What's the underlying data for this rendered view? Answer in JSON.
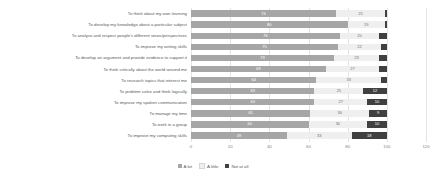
{
  "chart_data": {
    "type": "bar",
    "orientation": "horizontal",
    "stacked": true,
    "title": "",
    "subtitle": "",
    "xlabel": "",
    "ylabel": "",
    "xlim": [
      0,
      120
    ],
    "xticks": [
      "0",
      "20",
      "40",
      "60",
      "80",
      "100",
      "120"
    ],
    "grid": true,
    "legend_position": "bottom",
    "categories": [
      "To think about my own learning",
      "To develop my knowledge about a particular subject",
      "To analyse and respect people's different views/perspectives",
      "To improve my writing skills",
      "To develop an argument and provide evidence to support it",
      "To think critically about the world around me",
      "To research topics that interest me",
      "To problem solve and think logically",
      "To improve my spoken communication",
      "To manage my time",
      "To work in a group",
      "To improve my computing skills"
    ],
    "series": [
      {
        "name": "A lot",
        "color": "#a6a6a6",
        "values": [
          74,
          80,
          76,
          75,
          73,
          69,
          64,
          63,
          63,
          61,
          60,
          49
        ]
      },
      {
        "name": "A little",
        "color": "#efefef",
        "values": [
          25,
          19,
          20,
          22,
          23,
          27,
          33,
          25,
          27,
          30,
          30,
          33
        ]
      },
      {
        "name": "Not at all",
        "color": "#404040",
        "values": [
          1,
          1,
          4,
          3,
          4,
          4,
          3,
          12,
          10,
          9,
          10,
          18
        ]
      }
    ]
  }
}
